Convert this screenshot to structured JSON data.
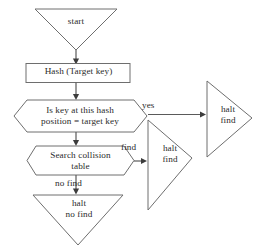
{
  "diagram": {
    "type": "flowchart",
    "colors": {
      "background": "#ffffff",
      "shape_stroke": "#6e6e6e",
      "connector": "#5a5a5a",
      "text": "#2b2b2b"
    },
    "nodes": [
      {
        "id": "start",
        "shape": "triangle-down",
        "label": "start"
      },
      {
        "id": "hash",
        "shape": "rectangle",
        "label": "Hash (Target key)"
      },
      {
        "id": "is-key-at-hash",
        "shape": "hexagon",
        "label": "Is key at this hash\nposition = target key"
      },
      {
        "id": "search-collision",
        "shape": "hexagon",
        "label": "Search collision\ntable"
      },
      {
        "id": "halt-no-find",
        "shape": "triangle-down",
        "label": "halt\nno find"
      },
      {
        "id": "halt-find-middle",
        "shape": "triangle-right",
        "label": "halt\nfind"
      },
      {
        "id": "halt-find-right",
        "shape": "triangle-right",
        "label": "halt\nfind"
      }
    ],
    "edges": [
      {
        "id": "start-to-hash",
        "from": "start",
        "to": "hash",
        "label": ""
      },
      {
        "id": "hash-to-is-key",
        "from": "hash",
        "to": "is-key-at-hash",
        "label": ""
      },
      {
        "id": "is-key-yes",
        "from": "is-key-at-hash",
        "to": "halt-find-right",
        "label": "yes"
      },
      {
        "id": "is-key-to-search",
        "from": "is-key-at-hash",
        "to": "search-collision",
        "label": ""
      },
      {
        "id": "search-find",
        "from": "search-collision",
        "to": "halt-find-middle",
        "label": "find"
      },
      {
        "id": "search-no-find",
        "from": "search-collision",
        "to": "halt-no-find",
        "label": "no find"
      }
    ]
  }
}
